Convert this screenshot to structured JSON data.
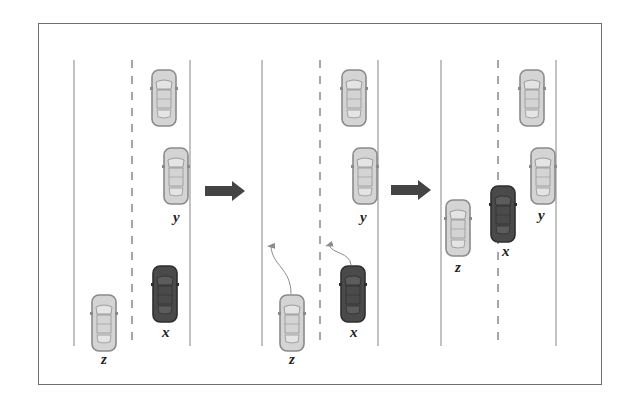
{
  "figure": {
    "colors": {
      "frame": "#6e6e6e",
      "lane_line": "#9a9a9a",
      "car_light_body": "#d4d4d4",
      "car_light_outline": "#8a8a8a",
      "car_dark_body": "#4a4a4a",
      "car_dark_outline": "#2e2e2e",
      "transition_arrow": "#444444",
      "trajectory": "#8c8c8c"
    },
    "panels": [
      {
        "id": "stage-1",
        "lanes": {
          "left_x": 74,
          "divider_x": 132,
          "right_x": 190,
          "top_y": 60,
          "bottom_y": 346
        },
        "vehicles": [
          {
            "name": "lead",
            "label": "",
            "shade": "light",
            "x": 152,
            "y": 70
          },
          {
            "name": "y",
            "label": "y",
            "shade": "light",
            "x": 164,
            "y": 148,
            "label_x": 173,
            "label_y": 222
          },
          {
            "name": "x",
            "label": "x",
            "shade": "dark",
            "x": 153,
            "y": 266,
            "label_x": 162,
            "label_y": 337
          },
          {
            "name": "z",
            "label": "z",
            "shade": "light",
            "x": 92,
            "y": 295,
            "label_x": 101,
            "label_y": 364
          }
        ],
        "trajectories": []
      },
      {
        "id": "stage-2",
        "lanes": {
          "left_x": 262,
          "divider_x": 320,
          "right_x": 378,
          "top_y": 60,
          "bottom_y": 346
        },
        "vehicles": [
          {
            "name": "lead",
            "label": "",
            "shade": "light",
            "x": 342,
            "y": 70
          },
          {
            "name": "y",
            "label": "y",
            "shade": "light",
            "x": 353,
            "y": 148,
            "label_x": 360,
            "label_y": 222
          },
          {
            "name": "x",
            "label": "x",
            "shade": "dark",
            "x": 341,
            "y": 266,
            "label_x": 350,
            "label_y": 337
          },
          {
            "name": "z",
            "label": "z",
            "shade": "light",
            "x": 280,
            "y": 295,
            "label_x": 289,
            "label_y": 364
          }
        ],
        "trajectories": [
          {
            "vehicle": "z",
            "path": "M291 294 C291 268 272 266 271 246"
          },
          {
            "vehicle": "x",
            "path": "M351 265 C350 252 332 254 329 245"
          }
        ]
      },
      {
        "id": "stage-3",
        "lanes": {
          "left_x": 441,
          "divider_x": 498,
          "right_x": 556,
          "top_y": 60,
          "bottom_y": 346
        },
        "vehicles": [
          {
            "name": "lead",
            "label": "",
            "shade": "light",
            "x": 520,
            "y": 70
          },
          {
            "name": "y",
            "label": "y",
            "shade": "light",
            "x": 531,
            "y": 148,
            "label_x": 538,
            "label_y": 220
          },
          {
            "name": "x",
            "label": "x",
            "shade": "dark",
            "x": 491,
            "y": 186,
            "label_x": 502,
            "label_y": 256
          },
          {
            "name": "z",
            "label": "z",
            "shade": "light",
            "x": 446,
            "y": 200,
            "label_x": 455,
            "label_y": 272
          }
        ],
        "trajectories": []
      }
    ],
    "transition_arrows": [
      {
        "id": "arrow-1-to-2",
        "x": 205,
        "y": 191
      },
      {
        "id": "arrow-2-to-3",
        "x": 391,
        "y": 190
      }
    ]
  }
}
